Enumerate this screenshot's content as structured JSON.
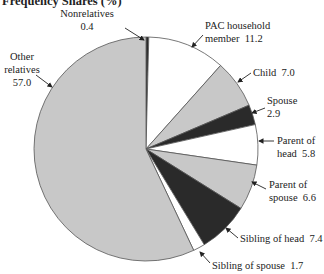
{
  "chart_data": {
    "type": "pie",
    "title": "Frequency Shares (%)",
    "start_angle_deg": 0,
    "direction": "clockwise",
    "slices": [
      {
        "label": "Nonrelatives",
        "value": 0.4,
        "color": "#2a2a2a",
        "label_lines": [
          "Nonrelatives",
          "0.4"
        ]
      },
      {
        "label": "PAC household member",
        "value": 11.2,
        "color": "#ffffff",
        "label_lines": [
          "PAC household",
          "member  11.2"
        ]
      },
      {
        "label": "Child",
        "value": 7.0,
        "color": "#c8c8c8",
        "label_lines": [
          "Child  7.0"
        ]
      },
      {
        "label": "Spouse",
        "value": 2.9,
        "color": "#2a2a2a",
        "label_lines": [
          "Spouse",
          "2.9"
        ]
      },
      {
        "label": "Parent of head",
        "value": 5.8,
        "color": "#ffffff",
        "label_lines": [
          "Parent of",
          "head  5.8"
        ]
      },
      {
        "label": "Parent of spouse",
        "value": 6.6,
        "color": "#c8c8c8",
        "label_lines": [
          "Parent of",
          "spouse  6.6"
        ]
      },
      {
        "label": "Sibling of head",
        "value": 7.4,
        "color": "#2a2a2a",
        "label_lines": [
          "Sibling of head  7.4"
        ]
      },
      {
        "label": "Sibling of spouse",
        "value": 1.7,
        "color": "#ffffff",
        "label_lines": [
          "Sibling of spouse  1.7"
        ]
      },
      {
        "label": "Other relatives",
        "value": 57.0,
        "color": "#c8c8c8",
        "label_lines": [
          "Other",
          "relatives",
          "57.0"
        ]
      }
    ],
    "legend": "none (direct labels with leader arrows)"
  },
  "layout": {
    "center": [
      146,
      149
    ],
    "radius": 112,
    "stroke": "#555555",
    "title_pos": [
      2,
      5
    ],
    "labels": [
      {
        "anchor": "middle",
        "x": 87,
        "y": 17,
        "line_h": 13,
        "arrow": [
          [
            125,
            28
          ],
          [
            144,
            40
          ]
        ]
      },
      {
        "anchor": "start",
        "x": 205,
        "y": 29,
        "line_h": 13,
        "arrow": [
          [
            203,
            35
          ],
          [
            192,
            47
          ]
        ]
      },
      {
        "anchor": "start",
        "x": 253,
        "y": 76,
        "line_h": 13,
        "arrow": [
          [
            251,
            73
          ],
          [
            238,
            82
          ]
        ]
      },
      {
        "anchor": "start",
        "x": 267,
        "y": 104,
        "line_h": 13,
        "arrow": [
          [
            265,
            108
          ],
          [
            252,
            113
          ]
        ]
      },
      {
        "anchor": "start",
        "x": 277,
        "y": 144,
        "line_h": 13,
        "arrow": [
          [
            274,
            141
          ],
          [
            259,
            141
          ]
        ]
      },
      {
        "anchor": "start",
        "x": 269,
        "y": 188,
        "line_h": 13,
        "arrow": [
          [
            266,
            189
          ],
          [
            252,
            182
          ]
        ]
      },
      {
        "anchor": "start",
        "x": 240,
        "y": 242,
        "line_h": 13,
        "arrow": [
          [
            238,
            238
          ],
          [
            226,
            228
          ]
        ]
      },
      {
        "anchor": "start",
        "x": 212,
        "y": 269,
        "line_h": 13,
        "arrow": [
          [
            210,
            263
          ],
          [
            200,
            252
          ]
        ]
      },
      {
        "anchor": "middle",
        "x": 22,
        "y": 60,
        "line_h": 13,
        "arrow": [
          [
            36,
            75
          ],
          [
            52,
            87
          ]
        ]
      }
    ]
  }
}
